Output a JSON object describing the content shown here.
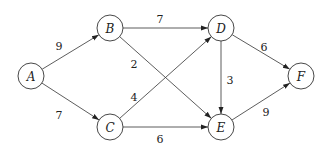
{
  "graph": {
    "type": "directed-weighted",
    "nodes": [
      {
        "id": "A",
        "label": "A",
        "x": 31,
        "y": 76
      },
      {
        "id": "B",
        "label": "B",
        "x": 110,
        "y": 28
      },
      {
        "id": "C",
        "label": "C",
        "x": 110,
        "y": 127
      },
      {
        "id": "D",
        "label": "D",
        "x": 221,
        "y": 28
      },
      {
        "id": "E",
        "label": "E",
        "x": 221,
        "y": 127
      },
      {
        "id": "F",
        "label": "F",
        "x": 301,
        "y": 76
      }
    ],
    "edges": [
      {
        "from": "A",
        "to": "B",
        "weight": "9",
        "lx": 59,
        "ly": 47
      },
      {
        "from": "A",
        "to": "C",
        "weight": "7",
        "lx": 59,
        "ly": 116
      },
      {
        "from": "B",
        "to": "D",
        "weight": "7",
        "lx": 160,
        "ly": 20
      },
      {
        "from": "B",
        "to": "E",
        "weight": "2",
        "lx": 134,
        "ly": 65
      },
      {
        "from": "C",
        "to": "D",
        "weight": "4",
        "lx": 134,
        "ly": 98
      },
      {
        "from": "C",
        "to": "E",
        "weight": "6",
        "lx": 160,
        "ly": 140
      },
      {
        "from": "D",
        "to": "E",
        "weight": "3",
        "lx": 230,
        "ly": 81
      },
      {
        "from": "D",
        "to": "F",
        "weight": "6",
        "lx": 264,
        "ly": 48
      },
      {
        "from": "E",
        "to": "F",
        "weight": "9",
        "lx": 266,
        "ly": 113
      }
    ]
  }
}
